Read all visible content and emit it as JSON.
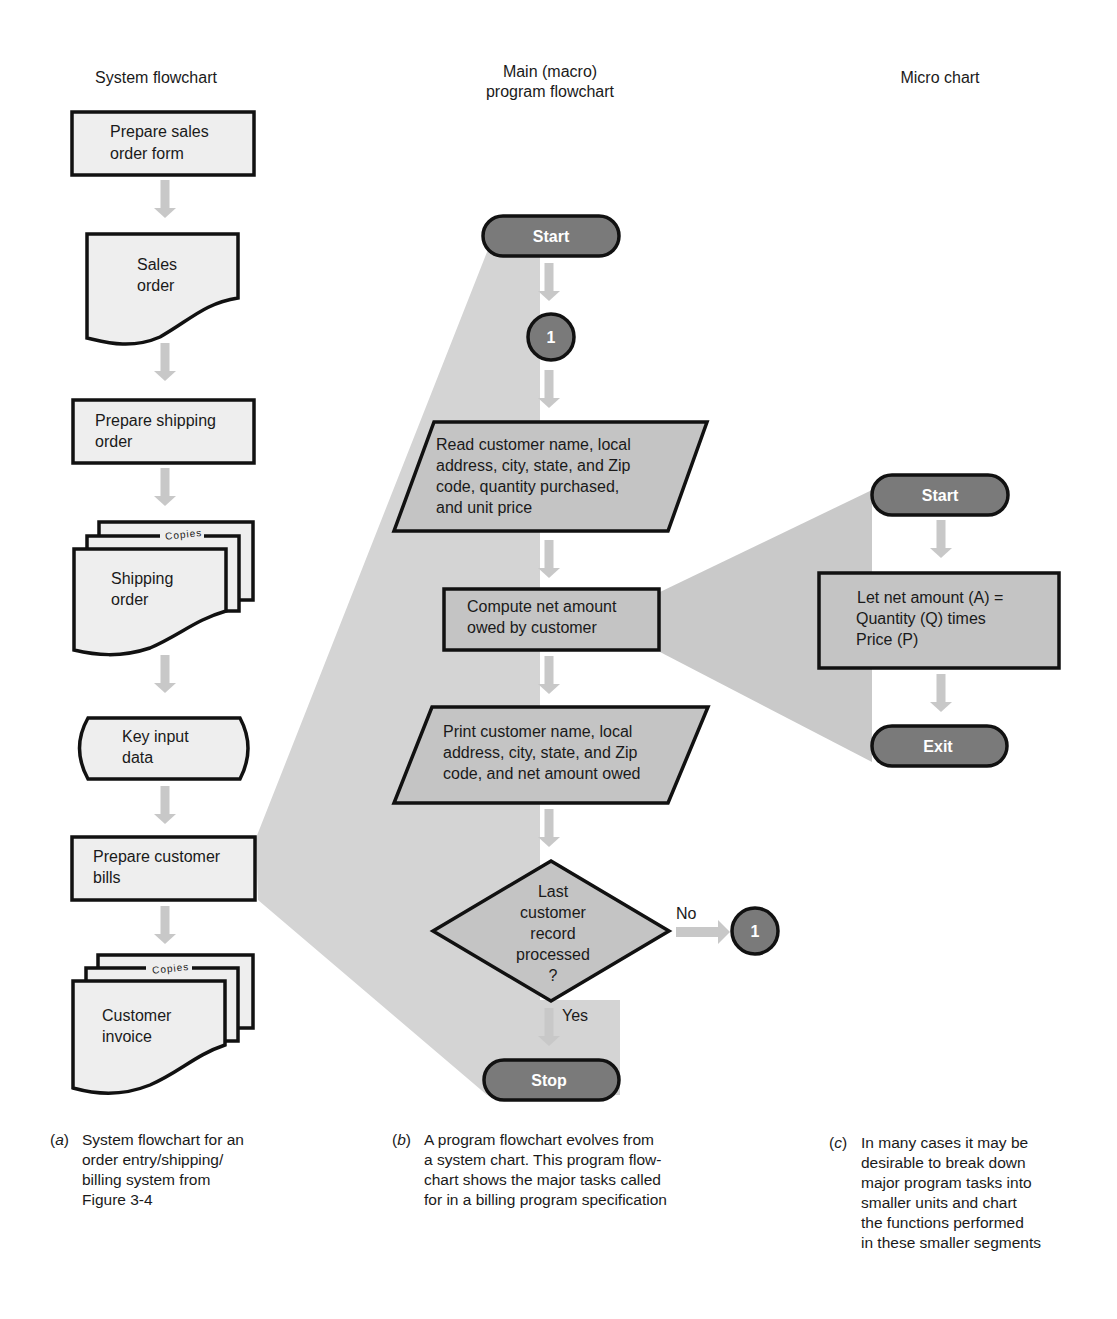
{
  "columns": {
    "system": {
      "title": "System flowchart"
    },
    "main": {
      "title_line1": "Main (macro)",
      "title_line2": "program flowchart"
    },
    "micro": {
      "title": "Micro chart"
    }
  },
  "system_flowchart": {
    "steps": [
      {
        "type": "process",
        "lines": [
          "Prepare sales",
          "order form"
        ]
      },
      {
        "type": "document",
        "lines": [
          "Sales",
          "order"
        ]
      },
      {
        "type": "process",
        "lines": [
          "Prepare shipping",
          "order"
        ]
      },
      {
        "type": "multi-document",
        "lines": [
          "Shipping",
          "order"
        ],
        "copies_label": "Copies"
      },
      {
        "type": "manual-input",
        "lines": [
          "Key input",
          "data"
        ]
      },
      {
        "type": "process",
        "lines": [
          "Prepare customer",
          "bills"
        ]
      },
      {
        "type": "multi-document",
        "lines": [
          "Customer",
          "invoice"
        ],
        "copies_label": "Copies"
      }
    ]
  },
  "main_flowchart": {
    "start_label": "Start",
    "connector_label": "1",
    "read_lines": [
      "Read customer name, local",
      "address, city, state, and Zip",
      "code, quantity purchased,",
      "and unit price"
    ],
    "compute_lines": [
      "Compute net amount",
      "owed by customer"
    ],
    "print_lines": [
      "Print customer name, local",
      "address, city, state, and Zip",
      "code, and net amount owed"
    ],
    "decision_lines": [
      "Last",
      "customer",
      "record",
      "processed",
      "?"
    ],
    "no_label": "No",
    "yes_label": "Yes",
    "loop_connector_label": "1",
    "stop_label": "Stop"
  },
  "micro_chart": {
    "start_label": "Start",
    "process_lines": [
      "Let net amount (A) =",
      "Quantity (Q) times",
      "Price (P)"
    ],
    "exit_label": "Exit"
  },
  "captions": {
    "a": {
      "tag": "a",
      "text": "System flowchart for an\norder entry/shipping/\nbilling system from\nFigure 3-4"
    },
    "b": {
      "tag": "b",
      "text": "A program flowchart evolves from\na system chart.  This program flow-\nchart shows the major tasks called\nfor in a billing program specification"
    },
    "c": {
      "tag": "c",
      "text": "In many cases it may be\ndesirable to break down\nmajor program tasks into\nsmaller units and chart\nthe functions performed\nin these smaller segments"
    }
  },
  "colors": {
    "wedge": "#d2d2d2",
    "system_fill": "#eeeeee",
    "program_fill": "#c4c4c4",
    "terminal_fill": "#7a7a7a",
    "arrow": "#c8c8c8",
    "outline": "#111111"
  }
}
